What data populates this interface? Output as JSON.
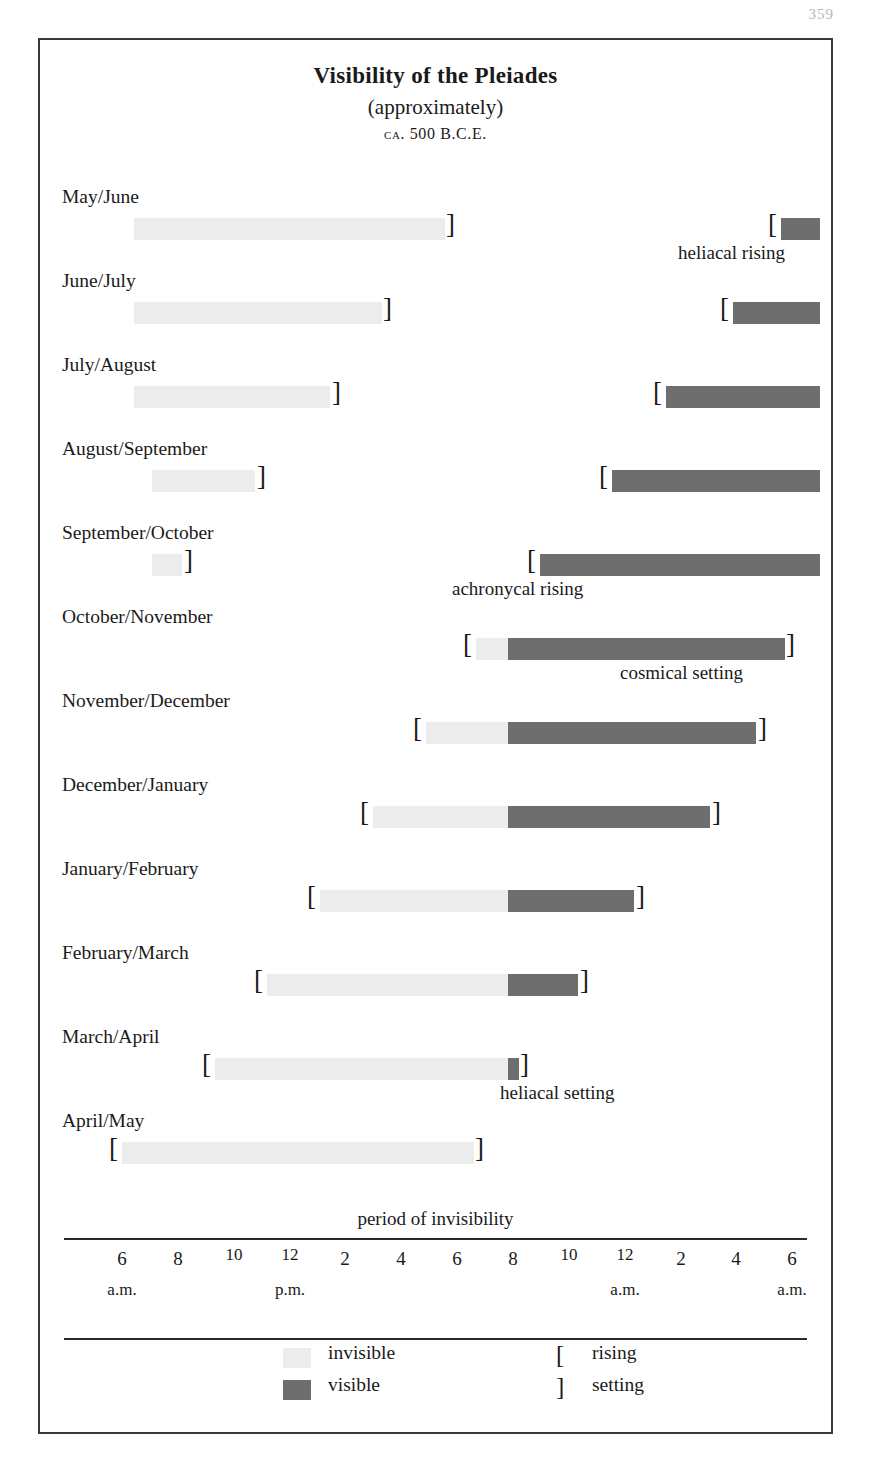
{
  "page_number": "359",
  "header": {
    "title": "Visibility of the Pleiades",
    "subtitle": "(approximately)",
    "date": "ca. 500 B.C.E."
  },
  "axis": {
    "note": "period of invisibility",
    "ticks": [
      "6",
      "8",
      "10",
      "12",
      "2",
      "4",
      "6",
      "8",
      "10",
      "12",
      "2",
      "4",
      "6"
    ],
    "ampm": [
      {
        "label": "a.m.",
        "tick_index": 0
      },
      {
        "label": "p.m.",
        "tick_index": 3
      },
      {
        "label": "a.m.",
        "tick_index": 9
      },
      {
        "label": "a.m.",
        "tick_index": 12
      }
    ]
  },
  "legend": {
    "invisible_label": "invisible",
    "visible_label": "visible",
    "rising_symbol": "[",
    "rising_label": "rising",
    "setting_symbol": "]",
    "setting_label": "setting"
  },
  "colors": {
    "invisible": "#ececec",
    "visible": "#6e6e6e",
    "frame": "#3a3a3a",
    "text": "#1a1a1a"
  },
  "chart_data": {
    "type": "bar",
    "title": "Visibility of the Pleiades",
    "subtitle": "(approximately)",
    "annotation_date": "ca. 500 B.C.E.",
    "xlabel": "",
    "ylabel": "",
    "orientation": "horizontal-gantt",
    "grid": false,
    "legend_position": "bottom",
    "x_axis": {
      "tick_labels": [
        "6",
        "8",
        "10",
        "12",
        "2",
        "4",
        "6",
        "8",
        "10",
        "12",
        "2",
        "4",
        "6"
      ],
      "tick_hours_from_6am": [
        0,
        2,
        4,
        6,
        8,
        10,
        12,
        14,
        16,
        18,
        20,
        22,
        24
      ],
      "tick_px": [
        120,
        176,
        232,
        288,
        343,
        399,
        455,
        511,
        567,
        623,
        679,
        734,
        790
      ],
      "range_px": [
        120,
        790
      ],
      "period_labels": [
        "a.m.",
        "p.m.",
        "a.m.",
        "a.m."
      ]
    },
    "categories": [
      "May/June",
      "June/July",
      "July/August",
      "August/September",
      "September/October",
      "October/November",
      "November/December",
      "December/January",
      "January/February",
      "February/March",
      "March/April",
      "April/May"
    ],
    "rows": [
      {
        "label": "May/June",
        "segments": [
          {
            "kind": "invisible",
            "x0": 132,
            "x1": 443
          },
          {
            "kind": "visible",
            "x0": 779,
            "x1": 818
          }
        ],
        "brackets": [
          {
            "symbol": "]",
            "x": 444
          },
          {
            "symbol": "[",
            "x": 766
          }
        ],
        "annotation": {
          "text": "heliacal rising",
          "x": 676
        }
      },
      {
        "label": "June/July",
        "segments": [
          {
            "kind": "invisible",
            "x0": 132,
            "x1": 380
          },
          {
            "kind": "visible",
            "x0": 731,
            "x1": 818
          }
        ],
        "brackets": [
          {
            "symbol": "]",
            "x": 381
          },
          {
            "symbol": "[",
            "x": 718
          }
        ],
        "annotation": null
      },
      {
        "label": "July/August",
        "segments": [
          {
            "kind": "invisible",
            "x0": 132,
            "x1": 328
          },
          {
            "kind": "visible",
            "x0": 664,
            "x1": 818
          }
        ],
        "brackets": [
          {
            "symbol": "]",
            "x": 330
          },
          {
            "symbol": "[",
            "x": 651
          }
        ],
        "annotation": null
      },
      {
        "label": "August/September",
        "segments": [
          {
            "kind": "invisible",
            "x0": 150,
            "x1": 253
          },
          {
            "kind": "visible",
            "x0": 610,
            "x1": 818
          }
        ],
        "brackets": [
          {
            "symbol": "]",
            "x": 255
          },
          {
            "symbol": "[",
            "x": 597
          }
        ],
        "annotation": null
      },
      {
        "label": "September/October",
        "segments": [
          {
            "kind": "invisible",
            "x0": 150,
            "x1": 180
          },
          {
            "kind": "visible",
            "x0": 538,
            "x1": 818
          }
        ],
        "brackets": [
          {
            "symbol": "]",
            "x": 182
          },
          {
            "symbol": "[",
            "x": 525
          }
        ],
        "annotation": {
          "text": "achronycal rising",
          "x": 450
        }
      },
      {
        "label": "October/November",
        "segments": [
          {
            "kind": "invisible",
            "x0": 474,
            "x1": 506
          },
          {
            "kind": "visible",
            "x0": 506,
            "x1": 783
          }
        ],
        "brackets": [
          {
            "symbol": "[",
            "x": 461
          },
          {
            "symbol": "]",
            "x": 784
          }
        ],
        "annotation": {
          "text": "cosmical setting",
          "x": 618
        }
      },
      {
        "label": "November/December",
        "segments": [
          {
            "kind": "invisible",
            "x0": 424,
            "x1": 506
          },
          {
            "kind": "visible",
            "x0": 506,
            "x1": 754
          }
        ],
        "brackets": [
          {
            "symbol": "[",
            "x": 411
          },
          {
            "symbol": "]",
            "x": 756
          }
        ],
        "annotation": null
      },
      {
        "label": "December/January",
        "segments": [
          {
            "kind": "invisible",
            "x0": 371,
            "x1": 506
          },
          {
            "kind": "visible",
            "x0": 506,
            "x1": 708
          }
        ],
        "brackets": [
          {
            "symbol": "[",
            "x": 358
          },
          {
            "symbol": "]",
            "x": 710
          }
        ],
        "annotation": null
      },
      {
        "label": "January/February",
        "segments": [
          {
            "kind": "invisible",
            "x0": 318,
            "x1": 506
          },
          {
            "kind": "visible",
            "x0": 506,
            "x1": 632
          }
        ],
        "brackets": [
          {
            "symbol": "[",
            "x": 305
          },
          {
            "symbol": "]",
            "x": 634
          }
        ],
        "annotation": null
      },
      {
        "label": "February/March",
        "segments": [
          {
            "kind": "invisible",
            "x0": 265,
            "x1": 506
          },
          {
            "kind": "visible",
            "x0": 506,
            "x1": 576
          }
        ],
        "brackets": [
          {
            "symbol": "[",
            "x": 252
          },
          {
            "symbol": "]",
            "x": 578
          }
        ],
        "annotation": null
      },
      {
        "label": "March/April",
        "segments": [
          {
            "kind": "invisible",
            "x0": 213,
            "x1": 506
          },
          {
            "kind": "visible",
            "x0": 506,
            "x1": 517
          }
        ],
        "brackets": [
          {
            "symbol": "[",
            "x": 200
          },
          {
            "symbol": "]",
            "x": 518
          }
        ],
        "annotation": {
          "text": "heliacal setting",
          "x": 498
        }
      },
      {
        "label": "April/May",
        "segments": [
          {
            "kind": "invisible",
            "x0": 120,
            "x1": 472
          }
        ],
        "brackets": [
          {
            "symbol": "[",
            "x": 107
          },
          {
            "symbol": "]",
            "x": 473
          }
        ],
        "annotation": null
      }
    ]
  }
}
